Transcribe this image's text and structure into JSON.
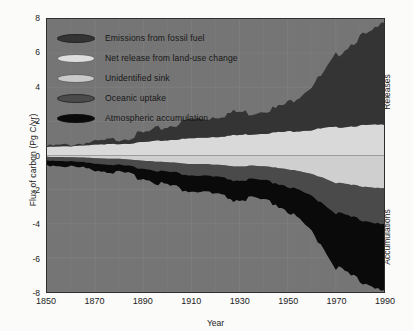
{
  "chart_data": {
    "type": "area",
    "title": "",
    "xlabel": "Year",
    "ylabel": "Flux of carbon (Pg C/yr)",
    "xlim": [
      1850,
      1990
    ],
    "ylim": [
      -8,
      8
    ],
    "xticks": [
      1850,
      1870,
      1890,
      1910,
      1930,
      1950,
      1970,
      1990
    ],
    "yticks": [
      8,
      6,
      4,
      2,
      0,
      -2,
      -4,
      -6,
      -8
    ],
    "grid": true,
    "legend_position": "upper-left-inside",
    "stacked": true,
    "side_labels": {
      "positive": "Releases",
      "negative": "Accumulations"
    },
    "colors": {
      "plot_background": "#757575",
      "grid": "#8a8a8a",
      "frame": "#2d2d2d",
      "emissions_fossil_fuel": "#343434",
      "net_release_land_use": "#d9d9d9",
      "unidentified_sink": "#cfcfcf",
      "oceanic_uptake": "#4a4a4a",
      "atmospheric_accumulation": "#0a0a0a"
    },
    "x": [
      1850,
      1855,
      1860,
      1865,
      1870,
      1875,
      1880,
      1885,
      1890,
      1895,
      1900,
      1905,
      1910,
      1915,
      1920,
      1925,
      1930,
      1935,
      1940,
      1945,
      1950,
      1955,
      1960,
      1965,
      1970,
      1975,
      1980,
      1985,
      1990
    ],
    "series": [
      {
        "name": "Emissions from fossil fuel",
        "direction": "positive",
        "values": [
          0.05,
          0.07,
          0.09,
          0.13,
          0.17,
          0.22,
          0.3,
          0.4,
          0.5,
          0.63,
          0.8,
          0.95,
          1.1,
          1.1,
          1.2,
          1.3,
          1.35,
          1.25,
          1.4,
          1.4,
          1.65,
          2.1,
          2.6,
          3.2,
          4.2,
          4.7,
          5.2,
          5.4,
          6.0
        ]
      },
      {
        "name": "Net release from land-use change",
        "direction": "positive",
        "values": [
          0.5,
          0.52,
          0.55,
          0.6,
          0.62,
          0.65,
          0.68,
          0.72,
          0.78,
          0.85,
          0.9,
          0.95,
          1.0,
          1.05,
          1.1,
          1.15,
          1.2,
          1.25,
          1.3,
          1.35,
          1.4,
          1.45,
          1.5,
          1.6,
          1.65,
          1.7,
          1.75,
          1.78,
          1.8
        ]
      },
      {
        "name": "Unidentified sink",
        "direction": "negative",
        "values": [
          -0.08,
          -0.09,
          -0.1,
          -0.12,
          -0.15,
          -0.18,
          -0.2,
          -0.25,
          -0.3,
          -0.35,
          -0.4,
          -0.45,
          -0.5,
          -0.5,
          -0.55,
          -0.6,
          -0.65,
          -0.6,
          -0.65,
          -0.7,
          -0.8,
          -0.95,
          -1.1,
          -1.3,
          -1.6,
          -1.7,
          -1.8,
          -1.85,
          -1.9
        ]
      },
      {
        "name": "Oceanic uptake",
        "direction": "negative",
        "values": [
          -0.2,
          -0.22,
          -0.24,
          -0.27,
          -0.3,
          -0.33,
          -0.36,
          -0.4,
          -0.45,
          -0.5,
          -0.55,
          -0.6,
          -0.65,
          -0.68,
          -0.72,
          -0.78,
          -0.82,
          -0.8,
          -0.85,
          -0.9,
          -1.0,
          -1.15,
          -1.3,
          -1.5,
          -1.75,
          -1.85,
          -1.95,
          -2.0,
          -2.1
        ]
      },
      {
        "name": "Atmospheric accumulation",
        "direction": "negative",
        "values": [
          -0.27,
          -0.29,
          -0.31,
          -0.34,
          -0.37,
          -0.41,
          -0.46,
          -0.52,
          -0.58,
          -0.68,
          -0.78,
          -0.88,
          -0.95,
          -0.95,
          -1.03,
          -1.12,
          -1.18,
          -1.1,
          -1.2,
          -1.25,
          -1.45,
          -1.75,
          -2.1,
          -2.6,
          -3.2,
          -3.4,
          -3.6,
          -3.7,
          -3.9
        ]
      }
    ]
  },
  "legend": {
    "items": [
      {
        "label": "Emissions from fossil fuel",
        "color": "#343434",
        "swatch_name": "legend-swatch-emissions-fossil-fuel"
      },
      {
        "label": "Net release from land-use change",
        "color": "#dedede",
        "swatch_name": "legend-swatch-net-release-land-use"
      },
      {
        "label": "Unidentified sink",
        "color": "#c9c9c9",
        "swatch_name": "legend-swatch-unidentified-sink"
      },
      {
        "label": "Oceanic uptake",
        "color": "#4a4a4a",
        "swatch_name": "legend-swatch-oceanic-uptake"
      },
      {
        "label": "Atmospheric accumulation",
        "color": "#0a0a0a",
        "swatch_name": "legend-swatch-atmospheric-accumulation"
      }
    ]
  },
  "axes": {
    "y_title": "Flux of carbon (Pg C/yr)",
    "x_title": "Year",
    "y_ticks": [
      "8",
      "6",
      "4",
      "2",
      "0",
      "-2",
      "-4",
      "-6",
      "-8"
    ],
    "x_ticks": [
      "1850",
      "1870",
      "1890",
      "1910",
      "1930",
      "1950",
      "1970",
      "1990"
    ],
    "right_label_top": "Releases",
    "right_label_bottom": "Accumulations"
  }
}
